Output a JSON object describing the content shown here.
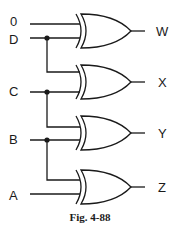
{
  "diagram": {
    "type": "logic-circuit",
    "gate_type": "XOR",
    "inputs": [
      "0",
      "D",
      "C",
      "B",
      "A"
    ],
    "outputs": [
      "W",
      "X",
      "Y",
      "Z"
    ],
    "gates": [
      {
        "id": "g1",
        "type": "XOR",
        "inputs": [
          "0",
          "D"
        ],
        "output": "W"
      },
      {
        "id": "g2",
        "type": "XOR",
        "inputs": [
          "D",
          "C"
        ],
        "output": "X"
      },
      {
        "id": "g3",
        "type": "XOR",
        "inputs": [
          "C",
          "B"
        ],
        "output": "Y"
      },
      {
        "id": "g4",
        "type": "XOR",
        "inputs": [
          "B",
          "A"
        ],
        "output": "Z"
      }
    ],
    "labels": {
      "in0": "0",
      "inD": "D",
      "inC": "C",
      "inB": "B",
      "inA": "A",
      "outW": "W",
      "outX": "X",
      "outY": "Y",
      "outZ": "Z"
    },
    "caption": "Fig. 4-88",
    "colors": {
      "ink": "#1a1a1a",
      "background": "#ffffff"
    }
  }
}
